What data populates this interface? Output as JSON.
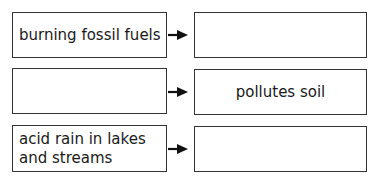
{
  "header": {
    "partial_text": ""
  },
  "rows": [
    {
      "cause": "burning fossil fuels",
      "effect": ""
    },
    {
      "cause": "",
      "effect": "pollutes soil"
    },
    {
      "cause": "acid rain in lakes and streams",
      "effect": ""
    }
  ]
}
